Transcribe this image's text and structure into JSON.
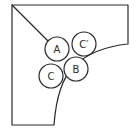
{
  "diagram": {
    "type": "geometry-figure",
    "stroke_color": "#2a2a2a",
    "background_color": "#ffffff",
    "circles": [
      {
        "id": "A",
        "label": "A",
        "cx": 57,
        "cy": 49,
        "r": 12
      },
      {
        "id": "C-prime",
        "label": "C′",
        "cx": 84,
        "cy": 44,
        "r": 12
      },
      {
        "id": "B",
        "label": "B",
        "cx": 76,
        "cy": 69,
        "r": 12
      },
      {
        "id": "C",
        "label": "C",
        "cx": 51,
        "cy": 76,
        "r": 12
      }
    ]
  }
}
